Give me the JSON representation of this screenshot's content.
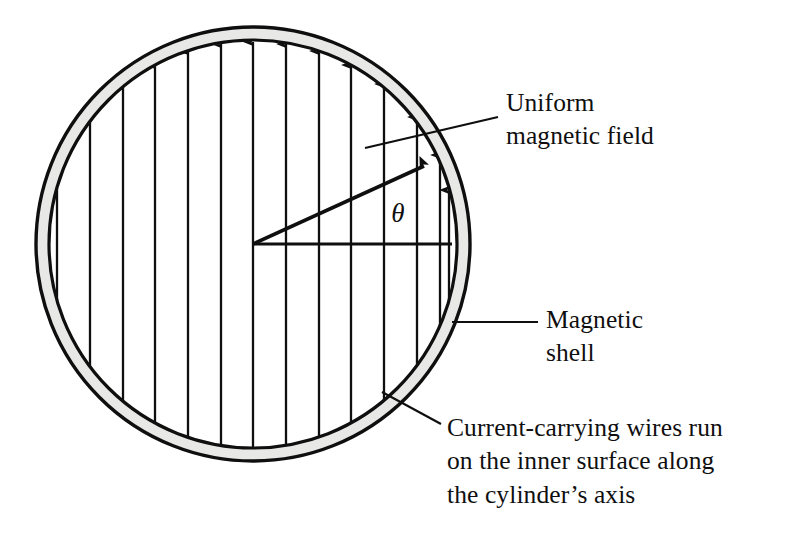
{
  "figure": {
    "type": "physics-diagram",
    "background_color": "#ffffff",
    "ink_color": "#100f10",
    "shell_fill_color": "#e8e8e6"
  },
  "annotations": {
    "angle_symbol": "θ"
  },
  "callouts": {
    "uniform_field": {
      "text": "Uniform\nmagnetic field",
      "line1": "Uniform",
      "line2": "magnetic field"
    },
    "magnetic_shell": {
      "text": "Magnetic\nshell",
      "line1": "Magnetic",
      "line2": "shell"
    },
    "wires": {
      "text": "Current-carrying wires run\non the inner surface along\nthe cylinder’s axis",
      "line1": "Current-carrying wires run",
      "line2": "on the inner surface along",
      "line3": "the cylinder’s axis"
    }
  },
  "geometry": {
    "center_x": 253,
    "center_y": 244,
    "outer_radius": 217,
    "inner_radius": 204,
    "field_arrow_count": 15,
    "field_arrow_spacing": 32.8,
    "field_arrow_direction": "up",
    "angle_theta_degrees": 23,
    "radius_line_endpoint_x": 452,
    "radius_line_endpoint_y": 244
  }
}
